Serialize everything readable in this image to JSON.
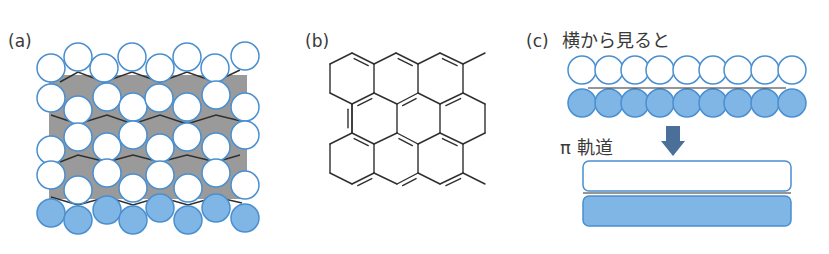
{
  "colors": {
    "white_atom_fill": "#ffffff",
    "atom_stroke": "#4a8fd0",
    "blue_atom_fill": "#7fb6e6",
    "gray_plane": "#9a9a9a",
    "bond_line": "#2f2f2f",
    "arrow": "#4a6f99",
    "text": "#3a3a3a"
  },
  "panels": {
    "a": {
      "label": "(a)",
      "atom_radius": 14,
      "gray_plane": {
        "x": 49,
        "y": 75,
        "w": 198,
        "h": 124
      },
      "white_atoms": [
        [
          51,
          68
        ],
        [
          78,
          57
        ],
        [
          104,
          68
        ],
        [
          132,
          57
        ],
        [
          160,
          68
        ],
        [
          187,
          57
        ],
        [
          215,
          68
        ],
        [
          245,
          56
        ],
        [
          51,
          98
        ],
        [
          78,
          110
        ],
        [
          107,
          97
        ],
        [
          133,
          107
        ],
        [
          159,
          98
        ],
        [
          187,
          107
        ],
        [
          216,
          95
        ],
        [
          245,
          107
        ],
        [
          78,
          137
        ],
        [
          133,
          135
        ],
        [
          187,
          137
        ],
        [
          245,
          135
        ],
        [
          51,
          150
        ],
        [
          107,
          147
        ],
        [
          160,
          148
        ],
        [
          216,
          147
        ],
        [
          51,
          175
        ],
        [
          107,
          173
        ],
        [
          160,
          175
        ],
        [
          216,
          173
        ],
        [
          78,
          190
        ],
        [
          133,
          188
        ],
        [
          188,
          188
        ],
        [
          245,
          185
        ]
      ],
      "blue_atoms": [
        [
          51,
          213
        ],
        [
          107,
          210
        ],
        [
          160,
          208
        ],
        [
          216,
          208
        ],
        [
          78,
          220
        ],
        [
          133,
          220
        ],
        [
          188,
          220
        ],
        [
          245,
          218
        ]
      ],
      "zigzag_lines": [
        [
          [
            60,
            82
          ],
          [
            78,
            72
          ],
          [
            104,
            82
          ],
          [
            132,
            72
          ],
          [
            160,
            82
          ],
          [
            187,
            72
          ],
          [
            215,
            82
          ],
          [
            240,
            70
          ]
        ],
        [
          [
            51,
            115
          ],
          [
            78,
            124
          ],
          [
            107,
            115
          ],
          [
            133,
            124
          ],
          [
            160,
            115
          ],
          [
            187,
            124
          ],
          [
            216,
            115
          ],
          [
            245,
            122
          ]
        ],
        [
          [
            60,
            162
          ],
          [
            78,
            155
          ],
          [
            107,
            162
          ],
          [
            133,
            155
          ],
          [
            160,
            162
          ],
          [
            187,
            155
          ],
          [
            216,
            162
          ],
          [
            240,
            155
          ]
        ],
        [
          [
            51,
            197
          ],
          [
            78,
            205
          ],
          [
            107,
            197
          ],
          [
            133,
            205
          ],
          [
            160,
            197
          ],
          [
            188,
            205
          ],
          [
            216,
            197
          ],
          [
            242,
            203
          ]
        ]
      ]
    },
    "b": {
      "label": "(b)",
      "single_bonds": [
        [
          [
            330,
            64
          ],
          [
            352,
            53
          ]
        ],
        [
          [
            330,
            64
          ],
          [
            330,
            93
          ]
        ],
        [
          [
            330,
            93
          ],
          [
            352,
            104
          ]
        ],
        [
          [
            374,
            64
          ],
          [
            396,
            53
          ]
        ],
        [
          [
            418,
            64
          ],
          [
            440,
            53
          ]
        ],
        [
          [
            463,
            64
          ],
          [
            485,
            53
          ]
        ],
        [
          [
            374,
            64
          ],
          [
            374,
            93
          ]
        ],
        [
          [
            418,
            64
          ],
          [
            418,
            93
          ]
        ],
        [
          [
            463,
            64
          ],
          [
            463,
            93
          ]
        ],
        [
          [
            352,
            104
          ],
          [
            352,
            133
          ]
        ],
        [
          [
            397,
            104
          ],
          [
            397,
            133
          ]
        ],
        [
          [
            440,
            104
          ],
          [
            440,
            133
          ]
        ],
        [
          [
            374,
            93
          ],
          [
            397,
            104
          ]
        ],
        [
          [
            418,
            93
          ],
          [
            440,
            104
          ]
        ],
        [
          [
            463,
            93
          ],
          [
            485,
            104
          ]
        ],
        [
          [
            485,
            104
          ],
          [
            485,
            133
          ]
        ],
        [
          [
            485,
            133
          ],
          [
            463,
            144
          ]
        ],
        [
          [
            352,
            133
          ],
          [
            330,
            144
          ]
        ],
        [
          [
            330,
            144
          ],
          [
            330,
            173
          ]
        ],
        [
          [
            330,
            173
          ],
          [
            352,
            184
          ]
        ],
        [
          [
            397,
            133
          ],
          [
            374,
            144
          ]
        ],
        [
          [
            440,
            133
          ],
          [
            418,
            144
          ]
        ],
        [
          [
            374,
            144
          ],
          [
            374,
            173
          ]
        ],
        [
          [
            418,
            144
          ],
          [
            418,
            173
          ]
        ],
        [
          [
            463,
            144
          ],
          [
            463,
            173
          ]
        ],
        [
          [
            374,
            173
          ],
          [
            397,
            184
          ]
        ],
        [
          [
            418,
            173
          ],
          [
            440,
            184
          ]
        ],
        [
          [
            463,
            173
          ],
          [
            485,
            184
          ]
        ]
      ],
      "double_bonds": [
        [
          [
            352,
            53
          ],
          [
            374,
            64
          ]
        ],
        [
          [
            396,
            53
          ],
          [
            418,
            64
          ]
        ],
        [
          [
            440,
            53
          ],
          [
            463,
            64
          ]
        ],
        [
          [
            352,
            104
          ],
          [
            374,
            93
          ]
        ],
        [
          [
            397,
            104
          ],
          [
            418,
            93
          ]
        ],
        [
          [
            440,
            104
          ],
          [
            463,
            93
          ]
        ],
        [
          [
            352,
            133
          ],
          [
            374,
            144
          ]
        ],
        [
          [
            397,
            133
          ],
          [
            418,
            144
          ]
        ],
        [
          [
            440,
            133
          ],
          [
            463,
            144
          ]
        ],
        [
          [
            352,
            184
          ],
          [
            374,
            173
          ]
        ],
        [
          [
            397,
            184
          ],
          [
            418,
            173
          ]
        ],
        [
          [
            440,
            184
          ],
          [
            463,
            173
          ]
        ],
        [
          [
            352,
            104
          ],
          [
            352,
            133
          ]
        ]
      ]
    },
    "c": {
      "label": "(c)",
      "caption": "横から見ると",
      "atom_radius": 14,
      "white_row_y": 70,
      "blue_row_y": 103,
      "atom_x": [
        582,
        609,
        635,
        660,
        687,
        713,
        738,
        765,
        792
      ],
      "plane_line_y": 88,
      "pi_label": "π 軌道",
      "arrow": {
        "x": 673,
        "top": 126,
        "head_top": 141,
        "tip": 156
      },
      "orbital_upper": {
        "x": 583,
        "y": 161,
        "w": 208,
        "h": 30
      },
      "orbital_lower": {
        "x": 583,
        "y": 196,
        "w": 208,
        "h": 30
      },
      "orbital_line_y": 193
    }
  }
}
